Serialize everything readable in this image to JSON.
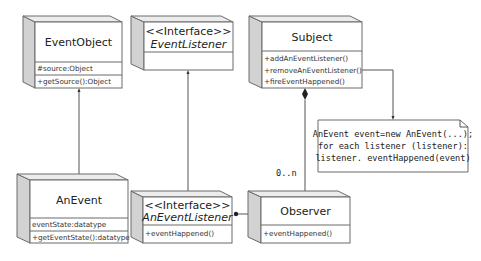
{
  "diagram": {
    "type": "UML class diagram",
    "classes": {
      "event_object": {
        "name": "EventObject",
        "stereotype": "",
        "attributes": [
          "#source:Object"
        ],
        "methods": [
          "+getSource():Object"
        ]
      },
      "event_listener": {
        "stereotype": "<<Interface>>",
        "name": "EventListener",
        "attributes": [],
        "methods": []
      },
      "subject": {
        "name": "Subject",
        "stereotype": "",
        "attributes": [],
        "methods": [
          "+addAnEventListener()",
          "+removeAnEventListener()",
          "+fireEventHappened()"
        ]
      },
      "an_event": {
        "name": "AnEvent",
        "stereotype": "",
        "attributes": [
          "eventState:datatype"
        ],
        "methods": [
          "+getEventState():datatype"
        ]
      },
      "an_event_listener": {
        "stereotype": "<<Interface>>",
        "name": "AnEventListener",
        "attributes": [],
        "methods": [
          "+eventHappened()"
        ]
      },
      "observer": {
        "name": "Observer",
        "stereotype": "",
        "attributes": [],
        "methods": [
          "+eventHappened()"
        ]
      }
    },
    "note": {
      "lines": [
        "AnEvent event=new AnEvent(...);",
        "for each listener (listener):",
        "listener. eventHappened(event)"
      ]
    },
    "multiplicity": "0..n",
    "relationships": [
      {
        "from": "AnEvent",
        "to": "EventObject",
        "kind": "generalization"
      },
      {
        "from": "AnEventListener",
        "to": "EventListener",
        "kind": "generalization"
      },
      {
        "from": "Subject",
        "to": "Observer",
        "kind": "composition",
        "multiplicity": "0..n"
      },
      {
        "from": "Observer",
        "to": "AnEventListener",
        "kind": "realization"
      },
      {
        "from": "Subject",
        "to": "Note",
        "kind": "note-link"
      }
    ]
  }
}
